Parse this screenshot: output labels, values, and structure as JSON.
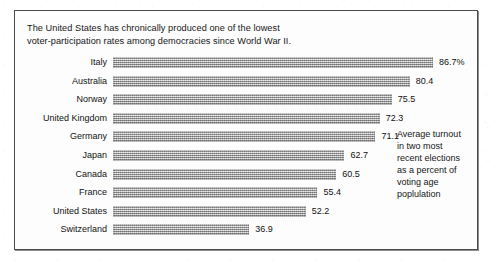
{
  "headline": "The United States has chronically produced one of the lowest\nvoter-participation rates among democracies since World War II.",
  "annotation": "Average turnout\nin two most\nrecent elections\nas a percent of\nvoting age\npoplulation",
  "chart_data": {
    "type": "bar",
    "orientation": "horizontal",
    "title": "The United States has chronically produced one of the lowest voter-participation rates among democracies since World War II.",
    "subtitle": "",
    "xlabel": "",
    "ylabel": "",
    "xlim": [
      0,
      86.7
    ],
    "grid": false,
    "legend": "none",
    "annotation": "Average turnout in two most recent elections as a percent of voting age poplulation",
    "categories": [
      "Italy",
      "Australia",
      "Norway",
      "United Kingdom",
      "Germany",
      "Japan",
      "Canada",
      "France",
      "United States",
      "Switzerland"
    ],
    "values": [
      86.7,
      80.4,
      75.5,
      72.3,
      71.1,
      62.7,
      60.5,
      55.4,
      52.2,
      36.9
    ],
    "value_labels": [
      "86.7%",
      "80.4",
      "75.5",
      "72.3",
      "71.1",
      "62.7",
      "60.5",
      "55.4",
      "52.2",
      "36.9"
    ],
    "bar_color": "#a8a8a8"
  }
}
